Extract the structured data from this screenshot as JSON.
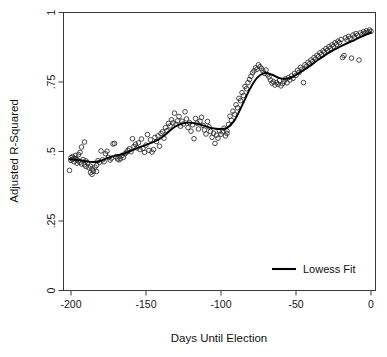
{
  "chart_data": {
    "type": "scatter",
    "title": "",
    "xlabel": "Days Until Election",
    "ylabel": "Adjusted R-Squared",
    "xlim": [
      -205,
      3
    ],
    "ylim": [
      0,
      1
    ],
    "xticks": [
      -200,
      -150,
      -100,
      -50,
      0
    ],
    "xtick_labels": [
      "-200",
      "-150",
      "-100",
      "-50",
      "0"
    ],
    "yticks": [
      0,
      0.25,
      0.5,
      0.75,
      1
    ],
    "ytick_labels": [
      "0",
      ".25",
      ".5",
      ".75",
      "1"
    ],
    "grid": false,
    "legend": {
      "position": "bottom-right",
      "entries": [
        {
          "label": "Lowess Fit",
          "marker": "line",
          "color": "#000000"
        }
      ]
    },
    "marker_style": {
      "shape": "open-circle",
      "radius": 2.3,
      "stroke": "#2b2b2b",
      "fill": "none"
    },
    "series": [
      {
        "name": "Adjusted R-Squared by day",
        "type": "scatter",
        "points": [
          [
            -201,
            0.432
          ],
          [
            -200,
            0.478
          ],
          [
            -200,
            0.468
          ],
          [
            -199,
            0.482
          ],
          [
            -199,
            0.472
          ],
          [
            -198,
            0.476
          ],
          [
            -198,
            0.463
          ],
          [
            -197,
            0.486
          ],
          [
            -197,
            0.474
          ],
          [
            -196,
            0.47
          ],
          [
            -196,
            0.458
          ],
          [
            -195,
            0.489
          ],
          [
            -195,
            0.466
          ],
          [
            -194,
            0.497
          ],
          [
            -194,
            0.462
          ],
          [
            -193,
            0.516
          ],
          [
            -193,
            0.455
          ],
          [
            -192,
            0.471
          ],
          [
            -191,
            0.534
          ],
          [
            -191,
            0.452
          ],
          [
            -190,
            0.466
          ],
          [
            -190,
            0.446
          ],
          [
            -189,
            0.459
          ],
          [
            -188,
            0.441
          ],
          [
            -187,
            0.447
          ],
          [
            -187,
            0.424
          ],
          [
            -186,
            0.437
          ],
          [
            -186,
            0.418
          ],
          [
            -185,
            0.43
          ],
          [
            -184,
            0.444
          ],
          [
            -183,
            0.45
          ],
          [
            -183,
            0.428
          ],
          [
            -182,
            0.467
          ],
          [
            -181,
            0.461
          ],
          [
            -180,
            0.502
          ],
          [
            -179,
            0.47
          ],
          [
            -178,
            0.463
          ],
          [
            -177,
            0.492
          ],
          [
            -176,
            0.501
          ],
          [
            -175,
            0.478
          ],
          [
            -174,
            0.469
          ],
          [
            -173,
            0.476
          ],
          [
            -172,
            0.527
          ],
          [
            -171,
            0.529
          ],
          [
            -170,
            0.481
          ],
          [
            -169,
            0.473
          ],
          [
            -168,
            0.47
          ],
          [
            -167,
            0.474
          ],
          [
            -166,
            0.486
          ],
          [
            -165,
            0.479
          ],
          [
            -164,
            0.492
          ],
          [
            -163,
            0.497
          ],
          [
            -162,
            0.504
          ],
          [
            -161,
            0.51
          ],
          [
            -160,
            0.499
          ],
          [
            -159,
            0.546
          ],
          [
            -158,
            0.518
          ],
          [
            -157,
            0.526
          ],
          [
            -156,
            0.513
          ],
          [
            -155,
            0.531
          ],
          [
            -154,
            0.507
          ],
          [
            -153,
            0.545
          ],
          [
            -152,
            0.511
          ],
          [
            -151,
            0.497
          ],
          [
            -150,
            0.523
          ],
          [
            -149,
            0.561
          ],
          [
            -148,
            0.504
          ],
          [
            -147,
            0.542
          ],
          [
            -146,
            0.498
          ],
          [
            -145,
            0.507
          ],
          [
            -144,
            0.551
          ],
          [
            -143,
            0.536
          ],
          [
            -142,
            0.556
          ],
          [
            -141,
            0.519
          ],
          [
            -140,
            0.565
          ],
          [
            -139,
            0.571
          ],
          [
            -138,
            0.548
          ],
          [
            -137,
            0.586
          ],
          [
            -136,
            0.575
          ],
          [
            -135,
            0.601
          ],
          [
            -134,
            0.592
          ],
          [
            -133,
            0.614
          ],
          [
            -132,
            0.603
          ],
          [
            -131,
            0.638
          ],
          [
            -130,
            0.598
          ],
          [
            -129,
            0.61
          ],
          [
            -128,
            0.626
          ],
          [
            -127,
            0.591
          ],
          [
            -126,
            0.609
          ],
          [
            -125,
            0.599
          ],
          [
            -124,
            0.643
          ],
          [
            -123,
            0.617
          ],
          [
            -122,
            0.586
          ],
          [
            -121,
            0.604
          ],
          [
            -120,
            0.573
          ],
          [
            -119,
            0.596
          ],
          [
            -118,
            0.546
          ],
          [
            -117,
            0.619
          ],
          [
            -116,
            0.602
          ],
          [
            -115,
            0.581
          ],
          [
            -114,
            0.609
          ],
          [
            -113,
            0.623
          ],
          [
            -112,
            0.594
          ],
          [
            -111,
            0.577
          ],
          [
            -110,
            0.563
          ],
          [
            -109,
            0.608
          ],
          [
            -108,
            0.589
          ],
          [
            -107,
            0.572
          ],
          [
            -106,
            0.551
          ],
          [
            -105,
            0.566
          ],
          [
            -104,
            0.529
          ],
          [
            -103,
            0.559
          ],
          [
            -102,
            0.548
          ],
          [
            -101,
            0.575
          ],
          [
            -100,
            0.562
          ],
          [
            -99,
            0.571
          ],
          [
            -98,
            0.584
          ],
          [
            -97,
            0.556
          ],
          [
            -96,
            0.574
          ],
          [
            -96,
            0.565
          ],
          [
            -95,
            0.597
          ],
          [
            -94,
            0.627
          ],
          [
            -93,
            0.612
          ],
          [
            -92,
            0.645
          ],
          [
            -91,
            0.634
          ],
          [
            -90,
            0.668
          ],
          [
            -89,
            0.657
          ],
          [
            -88,
            0.691
          ],
          [
            -87,
            0.683
          ],
          [
            -86,
            0.712
          ],
          [
            -85,
            0.701
          ],
          [
            -84,
            0.734
          ],
          [
            -83,
            0.726
          ],
          [
            -82,
            0.748
          ],
          [
            -81,
            0.759
          ],
          [
            -80,
            0.771
          ],
          [
            -79,
            0.783
          ],
          [
            -78,
            0.79
          ],
          [
            -77,
            0.801
          ],
          [
            -76,
            0.796
          ],
          [
            -75,
            0.812
          ],
          [
            -74,
            0.805
          ],
          [
            -73,
            0.798
          ],
          [
            -72,
            0.789
          ],
          [
            -71,
            0.781
          ],
          [
            -70,
            0.793
          ],
          [
            -69,
            0.776
          ],
          [
            -68,
            0.768
          ],
          [
            -67,
            0.757
          ],
          [
            -66,
            0.746
          ],
          [
            -65,
            0.751
          ],
          [
            -64,
            0.739
          ],
          [
            -63,
            0.748
          ],
          [
            -62,
            0.742
          ],
          [
            -61,
            0.755
          ],
          [
            -60,
            0.736
          ],
          [
            -59,
            0.744
          ],
          [
            -58,
            0.752
          ],
          [
            -57,
            0.761
          ],
          [
            -56,
            0.747
          ],
          [
            -55,
            0.766
          ],
          [
            -54,
            0.757
          ],
          [
            -53,
            0.772
          ],
          [
            -52,
            0.763
          ],
          [
            -51,
            0.781
          ],
          [
            -50,
            0.774
          ],
          [
            -49,
            0.792
          ],
          [
            -48,
            0.785
          ],
          [
            -47,
            0.803
          ],
          [
            -46,
            0.796
          ],
          [
            -45,
            0.748
          ],
          [
            -44,
            0.812
          ],
          [
            -43,
            0.806
          ],
          [
            -42,
            0.821
          ],
          [
            -41,
            0.815
          ],
          [
            -40,
            0.829
          ],
          [
            -39,
            0.823
          ],
          [
            -38,
            0.838
          ],
          [
            -37,
            0.832
          ],
          [
            -36,
            0.846
          ],
          [
            -35,
            0.841
          ],
          [
            -34,
            0.855
          ],
          [
            -33,
            0.849
          ],
          [
            -32,
            0.862
          ],
          [
            -31,
            0.858
          ],
          [
            -30,
            0.87
          ],
          [
            -29,
            0.864
          ],
          [
            -28,
            0.877
          ],
          [
            -27,
            0.871
          ],
          [
            -26,
            0.884
          ],
          [
            -25,
            0.878
          ],
          [
            -24,
            0.891
          ],
          [
            -23,
            0.885
          ],
          [
            -22,
            0.897
          ],
          [
            -21,
            0.892
          ],
          [
            -20,
            0.903
          ],
          [
            -19,
            0.838
          ],
          [
            -18,
            0.845
          ],
          [
            -17,
            0.909
          ],
          [
            -16,
            0.901
          ],
          [
            -15,
            0.914
          ],
          [
            -14,
            0.907
          ],
          [
            -13,
            0.836
          ],
          [
            -12,
            0.919
          ],
          [
            -11,
            0.912
          ],
          [
            -10,
            0.924
          ],
          [
            -9,
            0.918
          ],
          [
            -8,
            0.829
          ],
          [
            -7,
            0.927
          ],
          [
            -6,
            0.921
          ],
          [
            -5,
            0.931
          ],
          [
            -4,
            0.926
          ],
          [
            -3,
            0.934
          ],
          [
            -2,
            0.929
          ],
          [
            -1,
            0.937
          ],
          [
            0,
            0.932
          ]
        ]
      },
      {
        "name": "Lowess Fit",
        "type": "line",
        "points": [
          [
            -201,
            0.472
          ],
          [
            -196,
            0.47
          ],
          [
            -191,
            0.466
          ],
          [
            -186,
            0.462
          ],
          [
            -181,
            0.465
          ],
          [
            -176,
            0.476
          ],
          [
            -171,
            0.484
          ],
          [
            -166,
            0.49
          ],
          [
            -161,
            0.5
          ],
          [
            -156,
            0.512
          ],
          [
            -151,
            0.522
          ],
          [
            -146,
            0.532
          ],
          [
            -141,
            0.545
          ],
          [
            -136,
            0.566
          ],
          [
            -131,
            0.588
          ],
          [
            -126,
            0.6
          ],
          [
            -121,
            0.604
          ],
          [
            -116,
            0.6
          ],
          [
            -111,
            0.592
          ],
          [
            -106,
            0.584
          ],
          [
            -101,
            0.581
          ],
          [
            -96,
            0.585
          ],
          [
            -91,
            0.612
          ],
          [
            -86,
            0.665
          ],
          [
            -81,
            0.722
          ],
          [
            -76,
            0.765
          ],
          [
            -71,
            0.782
          ],
          [
            -66,
            0.776
          ],
          [
            -61,
            0.764
          ],
          [
            -56,
            0.762
          ],
          [
            -51,
            0.772
          ],
          [
            -46,
            0.789
          ],
          [
            -41,
            0.807
          ],
          [
            -36,
            0.827
          ],
          [
            -31,
            0.845
          ],
          [
            -26,
            0.862
          ],
          [
            -21,
            0.876
          ],
          [
            -16,
            0.889
          ],
          [
            -11,
            0.901
          ],
          [
            -6,
            0.914
          ],
          [
            -1,
            0.926
          ],
          [
            0,
            0.929
          ]
        ]
      }
    ]
  },
  "legend": {
    "lowess_label": "Lowess Fit"
  },
  "axes": {
    "x_title": "Days Until Election",
    "y_title": "Adjusted R-Squared"
  }
}
